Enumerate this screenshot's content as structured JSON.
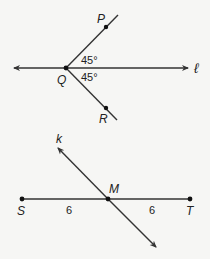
{
  "figures": [
    {
      "id": "angle-figure",
      "line_label": "ℓ",
      "vertex_label": "Q",
      "upper_point_label": "P",
      "lower_point_label": "R",
      "upper_angle": "45°",
      "lower_angle": "45°"
    },
    {
      "id": "bisector-figure",
      "line_label": "k",
      "left_endpoint_label": "S",
      "right_endpoint_label": "T",
      "midpoint_label": "M",
      "left_length": "6",
      "right_length": "6"
    }
  ],
  "colors": {
    "stroke": "#333333",
    "background": "#f6f6f4"
  }
}
